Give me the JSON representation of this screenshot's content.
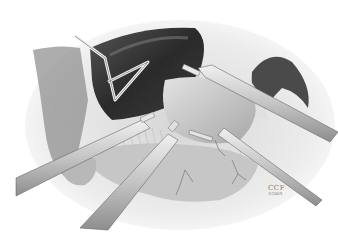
{
  "figure": {
    "type": "surgical-illustration",
    "style": "grayscale pencil drawing",
    "elements": [
      {
        "name": "liver-lobe",
        "shade": "#3a3a3a"
      },
      {
        "name": "triangle-liver-retractor",
        "shade": "#d8d8d8"
      },
      {
        "name": "stomach",
        "shade": "#bdbdbd"
      },
      {
        "name": "bowel-loops",
        "shade": "#c8c8c8"
      },
      {
        "name": "omentum-fat",
        "shade": "#e6e6e6"
      },
      {
        "name": "instrument-upper-right",
        "shade": "#cfcfcf"
      },
      {
        "name": "instrument-middle-right",
        "shade": "#cfcfcf"
      },
      {
        "name": "instrument-left",
        "shade": "#cfcfcf"
      },
      {
        "name": "instrument-bottom-center",
        "shade": "#cfcfcf"
      }
    ]
  },
  "credit": {
    "mark": "CCF",
    "year": "©2005"
  },
  "colors": {
    "background": "#ffffff",
    "dark_organ": "#2e2e2e",
    "mid_gray": "#9a9a9a",
    "light_gray": "#dcdcdc",
    "instrument": "#c9c9c9"
  }
}
